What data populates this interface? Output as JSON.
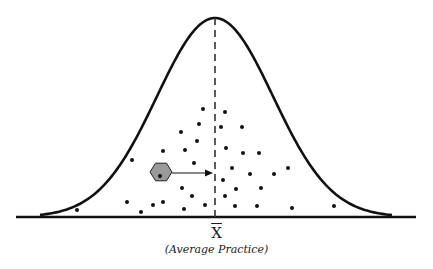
{
  "diagram": {
    "type": "normal-distribution-with-practice-points",
    "colors": {
      "stroke": "#111111",
      "dot": "#111111",
      "hexagon_fill": "#9a9a9a",
      "hexagon_stroke": "#222222",
      "dashed_line": "#333333",
      "background": "#ffffff"
    },
    "mean_symbol": "X",
    "mean_caption": "(Average Practice)",
    "baseline": {
      "x1": 16,
      "x2": 416,
      "y": 217
    },
    "mean_line": {
      "x": 215,
      "y_top": 18,
      "y_bottom": 217
    },
    "curve": {
      "mean_x": 215,
      "peak_y": 18,
      "base_y": 217,
      "sigma_px": 58,
      "x_start": 40,
      "x_end": 392
    },
    "highlighted_point": {
      "hexagon_center": [
        161,
        172
      ],
      "dot": [
        160,
        176
      ],
      "arrow_to": [
        213,
        173
      ]
    },
    "points": [
      [
        203,
        109
      ],
      [
        225,
        112
      ],
      [
        199,
        124
      ],
      [
        221,
        127
      ],
      [
        242,
        127
      ],
      [
        181,
        132
      ],
      [
        197,
        141
      ],
      [
        163,
        151
      ],
      [
        185,
        150
      ],
      [
        226,
        148
      ],
      [
        243,
        153
      ],
      [
        259,
        153
      ],
      [
        132,
        160
      ],
      [
        194,
        163
      ],
      [
        232,
        168
      ],
      [
        288,
        168
      ],
      [
        250,
        174
      ],
      [
        274,
        174
      ],
      [
        223,
        180
      ],
      [
        182,
        188
      ],
      [
        236,
        189
      ],
      [
        261,
        188
      ],
      [
        192,
        196
      ],
      [
        225,
        196
      ],
      [
        127,
        202
      ],
      [
        163,
        202
      ],
      [
        153,
        205
      ],
      [
        205,
        205
      ],
      [
        235,
        206
      ],
      [
        257,
        206
      ],
      [
        334,
        206
      ],
      [
        292,
        208
      ],
      [
        184,
        209
      ],
      [
        77,
        210
      ],
      [
        141,
        212
      ]
    ]
  }
}
